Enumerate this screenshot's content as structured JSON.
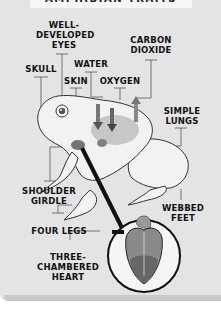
{
  "header": {
    "title": "AMPHIBIAN TRAITS"
  },
  "labels": {
    "eyes": "WELL-\nDEVELOPED\nEYES",
    "eyes_l1": "WELL-",
    "eyes_l2": "DEVELOPED",
    "eyes_l3": "EYES",
    "co2_l1": "CARBON",
    "co2_l2": "DIOXIDE",
    "skull": "SKULL",
    "water": "WATER",
    "skin": "SKIN",
    "oxygen": "OXYGEN",
    "lungs_l1": "SIMPLE",
    "lungs_l2": "LUNGS",
    "shoulder_l1": "SHOULDER",
    "shoulder_l2": "GIRDLE",
    "feet_l1": "WEBBED",
    "feet_l2": "FEET",
    "legs": "FOUR LEGS",
    "heart_l1": "THREE-",
    "heart_l2": "CHAMBERED",
    "heart_l3": "HEART"
  },
  "colors": {
    "background": "#e4e4e4",
    "text": "#111111",
    "leader_lines": "#555555",
    "frog_fill": "#f2f2f2",
    "frog_outline": "#333333",
    "heart_fill": "#8a8a8a"
  }
}
